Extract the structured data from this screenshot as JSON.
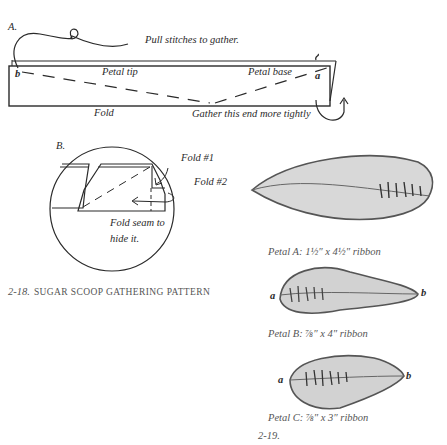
{
  "figure_a": {
    "label": "A.",
    "instruction": "Pull stitches to gather.",
    "end_b": "b",
    "end_a": "a",
    "petal_tip": "Petal tip",
    "petal_base": "Petal base",
    "fold": "Fold",
    "gather_note": "Gather this end more tightly"
  },
  "figure_b": {
    "label": "B.",
    "fold1": "Fold #1",
    "fold2": "Fold #2",
    "seam_note_line1": "Fold seam to",
    "seam_note_line2": "hide it."
  },
  "caption_218": {
    "number": "2-18.",
    "title": "SUGAR SCOOP GATHERING PATTERN"
  },
  "petals": [
    {
      "name": "Petal A",
      "caption": "Petal A: 1½″ x 4½″ ribbon"
    },
    {
      "name": "Petal B",
      "caption": "Petal B: ⅞″ x 4″ ribbon",
      "end_a": "a",
      "end_b": "b"
    },
    {
      "name": "Petal C",
      "caption": "Petal C: ⅞″ x 3″ ribbon",
      "end_a": "a",
      "end_b": "b"
    }
  ],
  "caption_219": {
    "number": "2-19."
  },
  "colors": {
    "ink": "#2a2a2a",
    "petal_fill": "#d6d6d6",
    "petal_shade": "#9a9a9a"
  }
}
